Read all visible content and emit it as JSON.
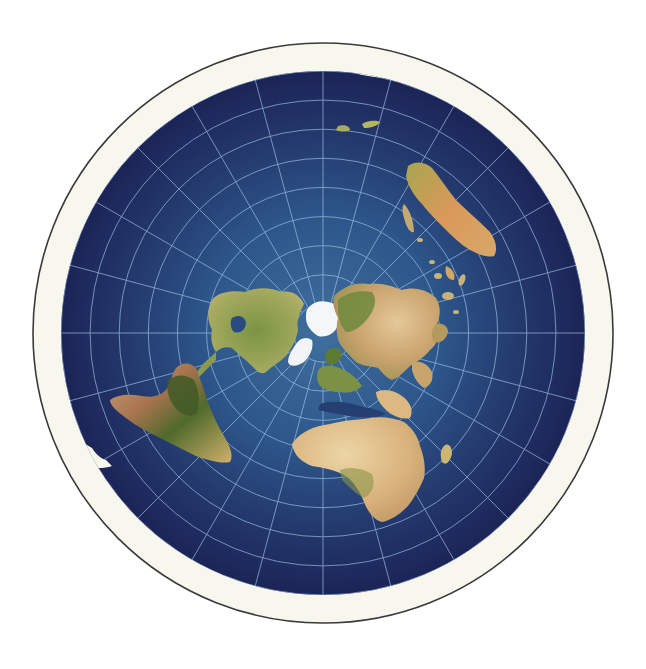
{
  "map": {
    "projection": "azimuthal equidistant (north polar)",
    "center": {
      "x": 323,
      "y": 333
    },
    "outer_radius": 290,
    "ocean_radius": 262,
    "colors": {
      "background": "#ffffff",
      "outline": "#3a3a3a",
      "ice_ring": "#f7f7ee",
      "ocean_center": "#3f6f9c",
      "ocean_mid": "#284c80",
      "ocean_edge": "#1c2457",
      "graticule": "#9fc3e6",
      "polar_ice": "#f4f6f8",
      "land_green": "#6b8a3a",
      "land_dark_green": "#3f5a26",
      "land_tan": "#d8b27a",
      "land_light": "#e6cf9c",
      "land_brown": "#b07a50"
    },
    "graticule": {
      "parallel_count": 9,
      "meridian_count": 24
    },
    "features": [
      {
        "name": "north-pole-ice",
        "label": "Arctic"
      },
      {
        "name": "north-america",
        "label": "North America"
      },
      {
        "name": "south-america",
        "label": "South America"
      },
      {
        "name": "greenland",
        "label": "Greenland"
      },
      {
        "name": "europe",
        "label": "Europe"
      },
      {
        "name": "asia",
        "label": "Asia"
      },
      {
        "name": "africa",
        "label": "Africa"
      },
      {
        "name": "madagascar",
        "label": "Madagascar"
      },
      {
        "name": "australia",
        "label": "Australia"
      },
      {
        "name": "indonesia",
        "label": "Indonesia"
      },
      {
        "name": "new-zealand",
        "label": "New Zealand"
      },
      {
        "name": "antarctic-ice-wall",
        "label": "Antarctica (ice ring)"
      }
    ]
  }
}
